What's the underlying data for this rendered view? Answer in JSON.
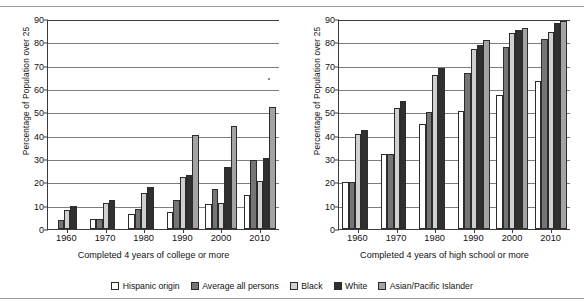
{
  "chart_data": [
    {
      "type": "bar",
      "panel": "left",
      "title": "",
      "xlabel": "Completed 4 years of college or more",
      "ylabel": "Percentage of Population over 25",
      "categories": [
        "1960",
        "1970",
        "1980",
        "1990",
        "2000",
        "2010"
      ],
      "yticks": [
        0,
        10,
        20,
        30,
        40,
        50,
        60,
        70,
        80,
        90
      ],
      "ylim": [
        0,
        90
      ],
      "grid": true,
      "legend_position": "bottom-center",
      "series": [
        {
          "name": "Hispanic origin",
          "color": "#ffffff",
          "values": [
            null,
            4.5,
            6.5,
            7.5,
            10.6,
            14.5
          ]
        },
        {
          "name": "Average all persons",
          "color": "#757575",
          "values": [
            3.7,
            4.3,
            8.4,
            12.4,
            17.3,
            29.5
          ]
        },
        {
          "name": "Black",
          "color": "#d0d0d0",
          "values": [
            8.2,
            11.3,
            15.4,
            22.2,
            11.2,
            20.5
          ]
        },
        {
          "name": "White",
          "color": "#303030",
          "values": [
            10.0,
            12.3,
            17.8,
            23.2,
            26.7,
            30.5
          ]
        },
        {
          "name": "Asian/Pacific Islander",
          "color": "#a3a3a3",
          "values": [
            null,
            null,
            null,
            40.4,
            44.1,
            52.4
          ]
        }
      ]
    },
    {
      "type": "bar",
      "panel": "right",
      "title": "",
      "xlabel": "Completed 4 years of high school or more",
      "ylabel": "Percentage of Population over 25",
      "categories": [
        "1960",
        "1970",
        "1980",
        "1990",
        "2000",
        "2010"
      ],
      "yticks": [
        0,
        10,
        20,
        30,
        40,
        50,
        60,
        70,
        80,
        90
      ],
      "ylim": [
        0,
        90
      ],
      "grid": true,
      "legend_position": "bottom-center",
      "series": [
        {
          "name": "Hispanic origin",
          "color": "#ffffff",
          "values": [
            20.1,
            32.1,
            45.0,
            50.4,
            57.3,
            63.5
          ]
        },
        {
          "name": "Average all persons",
          "color": "#757575",
          "values": [
            20.1,
            32.2,
            50.2,
            67.0,
            78.2,
            81.6
          ]
        },
        {
          "name": "Black",
          "color": "#d0d0d0",
          "values": [
            40.9,
            51.9,
            65.8,
            77.1,
            83.8,
            84.5
          ]
        },
        {
          "name": "White",
          "color": "#303030",
          "values": [
            42.6,
            54.8,
            69.1,
            78.8,
            85.3,
            88.4
          ]
        },
        {
          "name": "Asian/Pacific Islander",
          "color": "#a3a3a3",
          "values": [
            null,
            null,
            null,
            81.1,
            86.2,
            89.3
          ]
        }
      ]
    }
  ],
  "legend": {
    "items": [
      {
        "label": "Hispanic origin",
        "swatch": "s0"
      },
      {
        "label": "Average all persons",
        "swatch": "s1"
      },
      {
        "label": "Black",
        "swatch": "s2"
      },
      {
        "label": "White",
        "swatch": "s3"
      },
      {
        "label": "Asian/Pacific Islander",
        "swatch": "s4"
      }
    ]
  }
}
